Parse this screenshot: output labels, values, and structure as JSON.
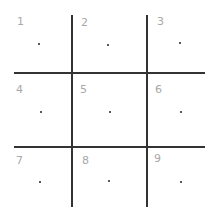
{
  "grid": {
    "rows": 3,
    "cols": 3,
    "line_color": "#333333",
    "label_color": "#a8a8a8",
    "cells": [
      {
        "label": "1",
        "label_pos": [
          17,
          16
        ],
        "dot_pos": [
          38,
          43
        ]
      },
      {
        "label": "2",
        "label_pos": [
          81,
          17
        ],
        "dot_pos": [
          107,
          44
        ]
      },
      {
        "label": "3",
        "label_pos": [
          157,
          16
        ],
        "dot_pos": [
          179,
          42
        ]
      },
      {
        "label": "4",
        "label_pos": [
          16,
          84
        ],
        "dot_pos": [
          40,
          111
        ]
      },
      {
        "label": "5",
        "label_pos": [
          80,
          84
        ],
        "dot_pos": [
          109,
          111
        ]
      },
      {
        "label": "6",
        "label_pos": [
          155,
          84
        ],
        "dot_pos": [
          180,
          111
        ]
      },
      {
        "label": "7",
        "label_pos": [
          16,
          155
        ],
        "dot_pos": [
          39,
          181
        ]
      },
      {
        "label": "8",
        "label_pos": [
          82,
          155
        ],
        "dot_pos": [
          108,
          180
        ]
      },
      {
        "label": "9",
        "label_pos": [
          154,
          153
        ],
        "dot_pos": [
          180,
          181
        ]
      }
    ]
  }
}
